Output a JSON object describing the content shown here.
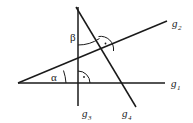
{
  "figure": {
    "type": "geometry-diagram",
    "background_color": "#ffffff",
    "stroke_color": "#1a1a1a",
    "width": 193,
    "height": 123
  },
  "lines": [
    {
      "id": "g1",
      "label_base": "g",
      "label_sub": "1",
      "role": "horizontal-baseline",
      "x1": 18,
      "y1": 83,
      "x2": 165,
      "y2": 83,
      "label_x": 171,
      "label_y": 87
    },
    {
      "id": "g2",
      "label_base": "g",
      "label_sub": "2",
      "role": "rising-diagonal",
      "x1": 18,
      "y1": 83,
      "x2": 167,
      "y2": 21,
      "label_x": 172,
      "label_y": 27
    },
    {
      "id": "g3",
      "label_base": "g",
      "label_sub": "3",
      "role": "vertical",
      "x1": 78,
      "y1": 7,
      "x2": 78,
      "y2": 106,
      "label_x": 82,
      "label_y": 117
    },
    {
      "id": "g4",
      "label_base": "g",
      "label_sub": "4",
      "role": "descending-diagonal",
      "x1": 76,
      "y1": 7,
      "x2": 136,
      "y2": 107,
      "label_x": 122,
      "label_y": 117
    }
  ],
  "angles": [
    {
      "id": "alpha",
      "symbol": "α",
      "vertex": "intersection of g1 and g2 at left",
      "label_x": 51,
      "label_y": 80,
      "marker": "arc"
    },
    {
      "id": "beta",
      "symbol": "β",
      "vertex": "intersection of g3 and g4 at top",
      "label_x": 70,
      "label_y": 40,
      "marker": "arc"
    }
  ],
  "right_angles": [
    {
      "id": "right-angle-g1-g3",
      "at": "intersection of g1 and g3",
      "cx": 78,
      "cy": 83,
      "radius": 12,
      "dot_x": 81,
      "dot_y": 76,
      "marker": "quarter-arc-with-dot"
    },
    {
      "id": "right-angle-g2-g4",
      "at": "intersection of g2 and g4",
      "cx": 106,
      "cy": 46,
      "radius": 12,
      "dot_x": 105,
      "dot_y": 52,
      "marker": "quarter-arc-with-dot"
    }
  ]
}
